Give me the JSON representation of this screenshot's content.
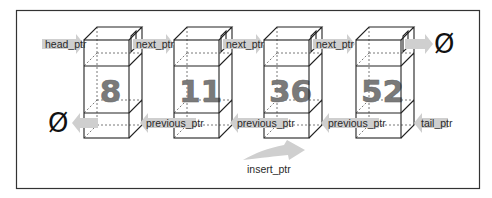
{
  "diagram": {
    "type": "doubly-linked-list",
    "nodes": [
      {
        "value": "8"
      },
      {
        "value": "11"
      },
      {
        "value": "36"
      },
      {
        "value": "52"
      }
    ],
    "labels": {
      "head": "head_ptr",
      "next": "next_ptr",
      "previous": "previous_ptr",
      "tail": "tail_ptr",
      "insert": "insert_ptr",
      "null_symbol": "Ø"
    },
    "colors": {
      "arrow": "#cfcfcf",
      "number": "#7a7a7a",
      "edge": "#222222",
      "frame": "#333333"
    }
  }
}
